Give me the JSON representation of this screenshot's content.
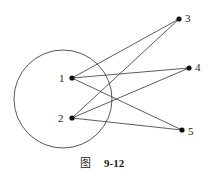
{
  "diagram": {
    "type": "graph",
    "circle": {
      "cx": 63,
      "cy": 99,
      "r": 49
    },
    "nodes": [
      {
        "id": "1",
        "label": "1",
        "x": 72,
        "y": 78
      },
      {
        "id": "2",
        "label": "2",
        "x": 72,
        "y": 118
      },
      {
        "id": "3",
        "label": "3",
        "x": 179,
        "y": 19
      },
      {
        "id": "4",
        "label": "4",
        "x": 189,
        "y": 68
      },
      {
        "id": "5",
        "label": "5",
        "x": 182,
        "y": 130
      }
    ],
    "edges": [
      [
        "1",
        "3"
      ],
      [
        "1",
        "4"
      ],
      [
        "1",
        "5"
      ],
      [
        "2",
        "3"
      ],
      [
        "2",
        "4"
      ],
      [
        "2",
        "5"
      ]
    ],
    "caption": {
      "prefix": "图",
      "number": "9-12"
    }
  }
}
